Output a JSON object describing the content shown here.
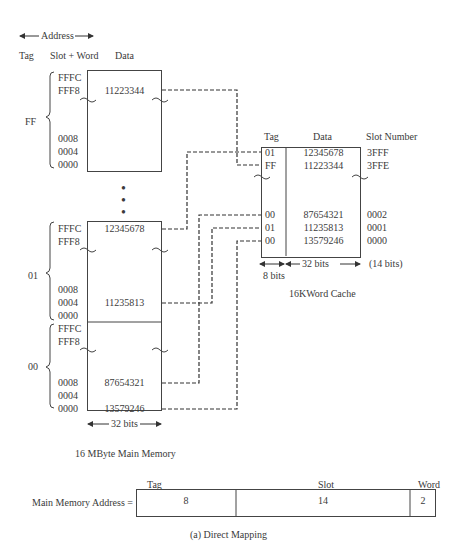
{
  "header": {
    "address_label": "Address",
    "col_tag": "Tag",
    "col_slot_word": "Slot + Word",
    "col_data": "Data"
  },
  "main_memory": {
    "title": "16 MByte Main Memory",
    "width_label": "32 bits",
    "blocks": [
      {
        "tag": "FF",
        "addresses_top": [
          "FFFC",
          "FFF8"
        ],
        "addresses_bottom": [
          "0008",
          "0004",
          "0000"
        ],
        "data_rows": [
          {
            "addr": "FFF8",
            "value": "11223344"
          }
        ]
      },
      {
        "tag": "01",
        "addresses_top": [
          "FFFC",
          "FFF8"
        ],
        "addresses_bottom": [
          "0008",
          "0004",
          "0000"
        ],
        "data_rows": [
          {
            "addr": "FFFC",
            "value": "12345678"
          },
          {
            "addr": "0004",
            "value": "11235813"
          }
        ]
      },
      {
        "tag": "00",
        "addresses_top": [
          "FFFC",
          "FFF8"
        ],
        "addresses_bottom": [
          "0008",
          "0004",
          "0000"
        ],
        "data_rows": [
          {
            "addr": "0008",
            "value": "87654321"
          },
          {
            "addr": "0000",
            "value": "13579246"
          }
        ]
      }
    ],
    "ellipsis": "⋮"
  },
  "cache": {
    "title": "16KWord Cache",
    "col_tag": "Tag",
    "col_data": "Data",
    "col_slot": "Slot Number",
    "tag_width": "8 bits",
    "data_width": "32 bits",
    "slot_width": "(14 bits)",
    "rows_top": [
      {
        "tag": "01",
        "data": "12345678",
        "slot": "3FFF"
      },
      {
        "tag": "FF",
        "data": "11223344",
        "slot": "3FFE"
      }
    ],
    "rows_bottom": [
      {
        "tag": "00",
        "data": "87654321",
        "slot": "0002"
      },
      {
        "tag": "01",
        "data": "11235813",
        "slot": "0001"
      },
      {
        "tag": "00",
        "data": "13579246",
        "slot": "0000"
      }
    ]
  },
  "address_format": {
    "label": "Main Memory Address =",
    "fields": [
      {
        "name": "Tag",
        "bits": "8"
      },
      {
        "name": "Slot",
        "bits": "14"
      },
      {
        "name": "Word",
        "bits": "2"
      }
    ]
  },
  "caption": "(a) Direct Mapping"
}
